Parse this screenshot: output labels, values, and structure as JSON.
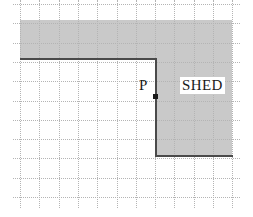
{
  "figure": {
    "type": "geometry-grid-diagram",
    "width": 253,
    "height": 217,
    "background_color": "#ffffff"
  },
  "grid": {
    "line_color": "#b4b4b4",
    "line_style": "dotted",
    "cell_size": 19.3,
    "origin_x": 20,
    "origin_y": 4,
    "columns": 11,
    "rows": 10,
    "vertical_positions": [
      0,
      19.3,
      38.6,
      57.9,
      77.2,
      96.5,
      115.8,
      135.1,
      154.4,
      173.7,
      193,
      212.3
    ],
    "horizontal_positions": [
      0,
      19.3,
      38.6,
      57.9,
      77.2,
      96.5,
      115.8,
      135.1,
      154.4,
      173.7,
      193
    ]
  },
  "shaded_region": {
    "name": "shed-region",
    "fill_color": "#c9c9c9",
    "edge_color": "#4a4a4a",
    "shape": "L-shaped",
    "parts": [
      {
        "name": "top-band",
        "x": 20,
        "y": 20,
        "width": 212,
        "height": 39
      },
      {
        "name": "right-band",
        "x": 155,
        "y": 59,
        "width": 77,
        "height": 97
      }
    ],
    "edges": [
      {
        "name": "inner-top-horizontal",
        "x": 20,
        "y": 58,
        "length": 136,
        "orientation": "horizontal"
      },
      {
        "name": "inner-vertical",
        "x": 155,
        "y": 58,
        "length": 98,
        "orientation": "vertical"
      },
      {
        "name": "inner-bottom-horizontal",
        "x": 155,
        "y": 155,
        "length": 78,
        "orientation": "horizontal"
      }
    ]
  },
  "labels": {
    "point_p": "P",
    "shed": "SHED"
  },
  "point_marker": {
    "name": "point-p-marker",
    "color": "#1a1a1a",
    "x": 153,
    "y": 94,
    "size": 5
  },
  "colors": {
    "shade": "#c9c9c9",
    "grid": "#b4b4b4",
    "edge": "#4a4a4a",
    "text": "#1a1a1a",
    "background": "#ffffff"
  }
}
